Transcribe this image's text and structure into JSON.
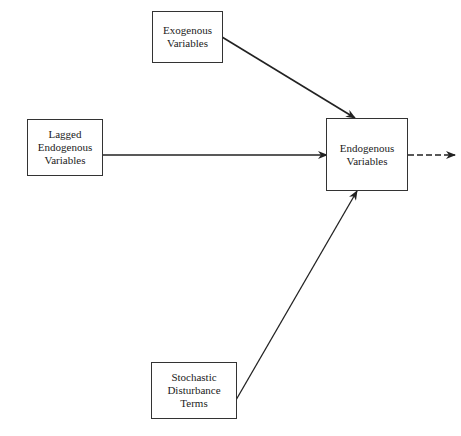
{
  "nodes": {
    "exogenous": {
      "lines": [
        "Exogenous",
        "Variables"
      ]
    },
    "lagged": {
      "lines": [
        "Lagged",
        "Endogenous",
        "Variables"
      ]
    },
    "endogenous": {
      "lines": [
        "Endogenous",
        "Variables"
      ]
    },
    "stochastic": {
      "lines": [
        "Stochastic",
        "Disturbance",
        "Terms"
      ]
    }
  },
  "edges": [
    {
      "from": "exogenous",
      "to": "endogenous",
      "style": "solid"
    },
    {
      "from": "lagged",
      "to": "endogenous",
      "style": "solid"
    },
    {
      "from": "stochastic",
      "to": "endogenous",
      "style": "solid"
    },
    {
      "from": "endogenous",
      "to": "output",
      "style": "dashed"
    }
  ]
}
